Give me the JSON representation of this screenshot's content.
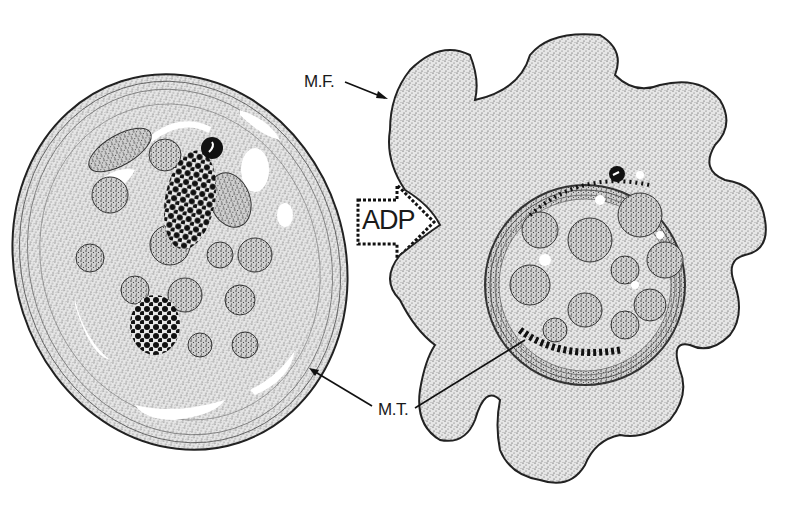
{
  "figure": {
    "stimulus_arrow": {
      "label": "ADP"
    },
    "labels": {
      "mf": "M.F.",
      "mt": "M.T."
    },
    "panels": [
      {
        "name": "resting-platelet",
        "shape": "ellipse"
      },
      {
        "name": "activated-platelet",
        "shape": "pseudopod-bearing"
      }
    ],
    "colors": {
      "ink": "#1a1a1a",
      "stipple": "#3a3a3a",
      "background": "#ffffff",
      "cytoplasm": "#d9d9d9",
      "granule": "#111111"
    }
  }
}
